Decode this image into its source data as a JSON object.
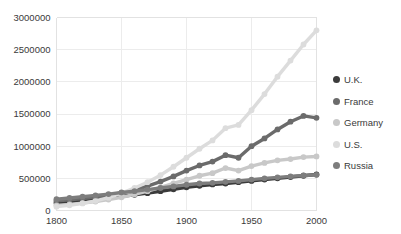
{
  "chart_data": {
    "type": "line",
    "title": "",
    "xlabel": "",
    "ylabel": "",
    "xlim": [
      1800,
      2000
    ],
    "ylim": [
      0,
      3000000
    ],
    "grid": true,
    "legend_position": "right",
    "marker": "circle",
    "xticks": [
      "1800",
      "1850",
      "1900",
      "1950",
      "2000"
    ],
    "xtick_values": [
      1800,
      1850,
      1900,
      1950,
      2000
    ],
    "yticks": [
      "0",
      "500000",
      "1000000",
      "1500000",
      "2000000",
      "2500000",
      "3000000"
    ],
    "ytick_values": [
      0,
      500000,
      1000000,
      1500000,
      2000000,
      2500000,
      3000000
    ],
    "x": [
      1800,
      1810,
      1820,
      1830,
      1840,
      1850,
      1860,
      1870,
      1880,
      1890,
      1900,
      1910,
      1920,
      1930,
      1940,
      1950,
      1960,
      1970,
      1980,
      1990,
      2000
    ],
    "series": [
      {
        "name": "U.K.",
        "color": "#3b3b3b",
        "values": [
          120000,
          140000,
          160000,
          180000,
          200000,
          220000,
          245000,
          270000,
          300000,
          330000,
          360000,
          385000,
          405000,
          420000,
          440000,
          460000,
          480000,
          500000,
          520000,
          540000,
          560000
        ]
      },
      {
        "name": "France",
        "color": "#6b6b6b",
        "values": [
          150000,
          165000,
          185000,
          210000,
          240000,
          275000,
          320000,
          380000,
          450000,
          530000,
          620000,
          700000,
          760000,
          860000,
          820000,
          1000000,
          1120000,
          1260000,
          1380000,
          1470000,
          1440000
        ]
      },
      {
        "name": "Germany",
        "color": "#c8c8c8",
        "values": [
          80000,
          95000,
          115000,
          140000,
          170000,
          205000,
          250000,
          300000,
          360000,
          420000,
          480000,
          540000,
          580000,
          660000,
          620000,
          690000,
          740000,
          780000,
          800000,
          830000,
          840000
        ]
      },
      {
        "name": "U.S.",
        "color": "#dcdcdc",
        "values": [
          60000,
          80000,
          110000,
          150000,
          200000,
          270000,
          350000,
          440000,
          550000,
          680000,
          820000,
          960000,
          1090000,
          1280000,
          1330000,
          1560000,
          1810000,
          2080000,
          2330000,
          2580000,
          2800000
        ]
      },
      {
        "name": "Russia",
        "color": "#7d7d7d",
        "values": [
          175000,
          195000,
          215000,
          235000,
          255000,
          280000,
          300000,
          325000,
          350000,
          375000,
          400000,
          420000,
          430000,
          445000,
          460000,
          480000,
          500000,
          515000,
          530000,
          545000,
          555000
        ]
      }
    ]
  },
  "legend": {
    "items": [
      {
        "label": "U.K.",
        "color": "#3b3b3b"
      },
      {
        "label": "France",
        "color": "#6b6b6b"
      },
      {
        "label": "Germany",
        "color": "#c8c8c8"
      },
      {
        "label": "U.S.",
        "color": "#dcdcdc"
      },
      {
        "label": "Russia",
        "color": "#7d7d7d"
      }
    ]
  }
}
